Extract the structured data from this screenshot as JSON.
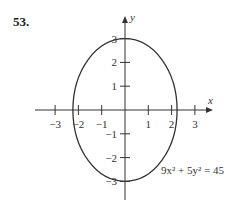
{
  "problem_number": "53.",
  "chart_data": {
    "type": "line",
    "title": "",
    "xlabel": "x",
    "ylabel": "y",
    "xlim": [
      -3.6,
      3.6
    ],
    "ylim": [
      -3.6,
      3.8
    ],
    "x_ticks": [
      -3,
      -2,
      -1,
      1,
      2,
      3
    ],
    "y_ticks": [
      -3,
      -2,
      -1,
      1,
      2,
      3
    ],
    "x_tick_labels": [
      "−3",
      "−2",
      "−1",
      "1",
      "2",
      "3"
    ],
    "y_tick_labels": [
      "−3",
      "−2",
      "−1",
      "1",
      "2",
      "3"
    ],
    "grid": false,
    "series": [
      {
        "name": "ellipse",
        "equation": "9x^2 + 5y^2 = 45",
        "shape": "ellipse",
        "center": [
          0,
          0
        ],
        "semi_axis_x": 2.236,
        "semi_axis_y": 3
      }
    ],
    "annotations": [
      {
        "text": "9x² + 5y² = 45",
        "position": "bottom-right"
      }
    ],
    "color": "#333333"
  }
}
